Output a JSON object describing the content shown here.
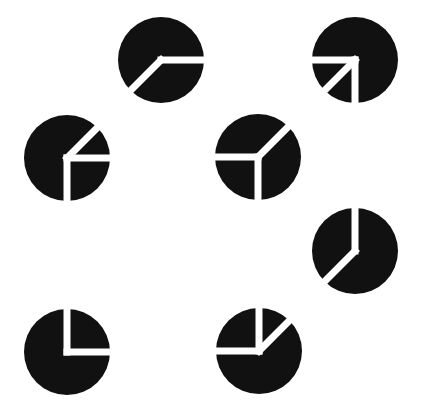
{
  "colors": {
    "background": "#ffffff",
    "fill": "#111111",
    "cut": "#ffffff"
  },
  "icon_size": 88,
  "radius": 43,
  "cut_width": 7,
  "icons": [
    {
      "name": "pie-icon-1",
      "cx": 161,
      "cy": 60,
      "cuts": [
        0,
        225
      ]
    },
    {
      "name": "pie-icon-2",
      "cx": 355,
      "cy": 60,
      "cuts": [
        180,
        270,
        225
      ]
    },
    {
      "name": "pie-icon-3",
      "cx": 67,
      "cy": 158,
      "cuts": [
        45,
        0,
        270
      ]
    },
    {
      "name": "pie-icon-4",
      "cx": 258,
      "cy": 157,
      "cuts": [
        180,
        270,
        45
      ]
    },
    {
      "name": "pie-icon-5",
      "cx": 355,
      "cy": 251,
      "cuts": [
        90,
        225
      ]
    },
    {
      "name": "pie-icon-6",
      "cx": 67,
      "cy": 352,
      "cuts": [
        90,
        0
      ]
    },
    {
      "name": "pie-icon-7",
      "cx": 259,
      "cy": 351,
      "cuts": [
        90,
        180,
        45
      ]
    }
  ]
}
